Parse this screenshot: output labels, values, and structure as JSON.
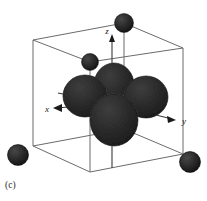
{
  "figure": {
    "caption": "(c)",
    "background_color": "#ffffff"
  },
  "axes": {
    "z": {
      "label": "z",
      "direction": "up",
      "arrow": "up"
    },
    "x": {
      "label": "x",
      "direction": "left-front",
      "arrow": "left"
    },
    "y": {
      "label": "y",
      "direction": "right",
      "arrow": "right"
    }
  },
  "colors": {
    "lobe_fill": "#2e2e2e",
    "lobe_outline": "#0d0d0d",
    "sphere_fill": "#2b2b2b",
    "sphere_outline": "#000000",
    "cube_edge": "#6b6b6b",
    "axis_line": "#3a3a3a",
    "caption_text": "#2b2b2b"
  },
  "cube": {
    "edge_count": 12,
    "vertices": [
      {
        "name": "back-top-left",
        "x": 33,
        "y": 40
      },
      {
        "name": "back-top-right",
        "x": 124,
        "y": 23
      },
      {
        "name": "front-top-right",
        "x": 183,
        "y": 48
      },
      {
        "name": "front-top-left",
        "x": 90,
        "y": 62
      },
      {
        "name": "back-bottom-left",
        "x": 33,
        "y": 146
      },
      {
        "name": "back-bottom-right",
        "x": 124,
        "y": 129
      },
      {
        "name": "front-bottom-right",
        "x": 183,
        "y": 154
      },
      {
        "name": "front-bottom-left",
        "x": 90,
        "y": 172
      }
    ]
  },
  "spheres": [
    {
      "name": "corner-sphere-top-back-right",
      "cx": 124,
      "cy": 23,
      "r": 9.5
    },
    {
      "name": "corner-sphere-top-back-left",
      "cx": 90,
      "cy": 62,
      "r": 8.5
    },
    {
      "name": "corner-sphere-bottom-left",
      "cx": 18,
      "cy": 155,
      "r": 10.5
    },
    {
      "name": "corner-sphere-bottom-right",
      "cx": 190,
      "cy": 162,
      "r": 10.5
    }
  ],
  "orbital": {
    "type": "d-orbital",
    "lobe_count": 5,
    "lobes": [
      {
        "name": "lobe-upper-center",
        "cx": 114,
        "cy": 85,
        "rx": 20,
        "ry": 22
      },
      {
        "name": "lobe-left",
        "cx": 85,
        "cy": 96,
        "rx": 22,
        "ry": 21
      },
      {
        "name": "lobe-right",
        "cx": 145,
        "cy": 97,
        "rx": 22,
        "ry": 21
      },
      {
        "name": "lobe-front-lower",
        "cx": 114,
        "cy": 119,
        "rx": 24,
        "ry": 26
      }
    ]
  }
}
